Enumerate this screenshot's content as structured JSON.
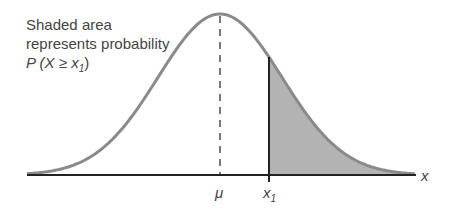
{
  "annotation": {
    "line1": "Shaded area",
    "line2": "represents probability",
    "line3_prefix": "P",
    "line3_body": " (X ≥ x",
    "line3_sub": "1",
    "line3_close": ")"
  },
  "axis": {
    "mu_label": "μ",
    "x1_label": "x",
    "x1_sub": "1",
    "x_label": "x"
  },
  "colors": {
    "curve": "#8a8a8a",
    "shade": "#b3b3b3",
    "axis": "#222222"
  }
}
